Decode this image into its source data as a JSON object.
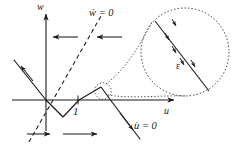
{
  "figure": {
    "type": "phase-plane-diagram",
    "background": "#ffffff",
    "ink": "#1a1a1a",
    "axes": {
      "horizontal_label": "u",
      "vertical_label": "w",
      "origin_px": [
        46,
        100
      ],
      "h_axis_px": [
        12,
        100,
        176,
        100
      ],
      "v_axis_px": [
        46,
        12,
        46,
        131
      ]
    },
    "tick_labels": [
      {
        "text": "1",
        "axis": "u",
        "x_px": 73,
        "y_px": 106
      }
    ],
    "nullclines": [
      {
        "name": "w-nullcline",
        "label": "ẇ = 0",
        "style": "dashed",
        "points_px": [
          [
            30,
            140
          ],
          [
            46,
            112
          ],
          [
            62,
            84
          ],
          [
            78,
            56
          ],
          [
            94,
            28
          ],
          [
            100,
            18
          ]
        ]
      },
      {
        "name": "u-nullcline",
        "label": "u̇ = 0",
        "style": "solid-piecewise-cubic",
        "points_px": [
          [
            14,
            60
          ],
          [
            46,
            100
          ],
          [
            62,
            116
          ],
          [
            78,
            100
          ],
          [
            100,
            86
          ],
          [
            112,
            102
          ],
          [
            132,
            128
          ],
          [
            140,
            138
          ]
        ]
      }
    ],
    "flow_arrows": [
      {
        "name": "arrow-top-left",
        "direction": "left",
        "x_px": 52,
        "y_px": 37,
        "length_px": 26
      },
      {
        "name": "arrow-top-right",
        "direction": "left",
        "x_px": 95,
        "y_px": 37,
        "length_px": 26
      },
      {
        "name": "arrow-bottom-left",
        "direction": "right",
        "x_px": 28,
        "y_px": 134,
        "length_px": 22
      },
      {
        "name": "arrow-bottom-right",
        "direction": "right",
        "x_px": 63,
        "y_px": 134,
        "length_px": 33
      },
      {
        "name": "arrow-on-left-branch",
        "direction": "up-left",
        "x_px": 22,
        "y_px": 72
      },
      {
        "name": "arrow-on-right-branch",
        "direction": "down-right",
        "x_px": 130,
        "y_px": 126
      }
    ],
    "inset": {
      "name": "magnified-detail",
      "shape": "circle",
      "outline_style": "dotted",
      "center_px": [
        185,
        52
      ],
      "radius_px": 44,
      "source_circle": {
        "center_px": [
          103,
          91
        ],
        "radius_px": 8,
        "outline_style": "dotted"
      },
      "connector_style": "dotted",
      "chord_px": [
        [
          156,
          22
        ],
        [
          208,
          90
        ]
      ],
      "epsilon_label": "ε",
      "small_arrows": 5,
      "small_arrow_direction": "down-right-across-chord"
    },
    "labels": {
      "w_axis": "w",
      "u_axis": "u",
      "w_nullcline": "ẇ = 0",
      "u_nullcline": "u̇ = 0",
      "tick_one": "1",
      "epsilon": "ε"
    }
  }
}
